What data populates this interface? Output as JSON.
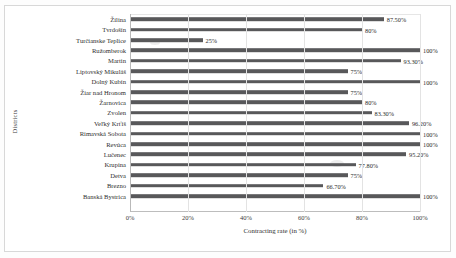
{
  "chart_data": {
    "type": "bar",
    "orientation": "horizontal",
    "title": "",
    "xlabel": "Contracting rate (in %)",
    "ylabel": "Districts",
    "xlim": [
      0,
      100
    ],
    "xticks": [
      "0%",
      "20%",
      "40%",
      "60%",
      "80%",
      "100%"
    ],
    "xtick_values": [
      0,
      20,
      40,
      60,
      80,
      100
    ],
    "grid": true,
    "legend": false,
    "bar_color": "#58585a",
    "categories": [
      "Žilina",
      "Tvrdošín",
      "Turčianske Teplice",
      "Ružomberok",
      "Martin",
      "Liptovský Mikuláš",
      "Dolný Kubín",
      "Žiar nad Hronom",
      "Žarnovica",
      "Zvolen",
      "Veľký Krťíš",
      "Rimavská Sobota",
      "Revúca",
      "Lučenec",
      "Krupina",
      "Detva",
      "Brezno",
      "Banská Bystrica"
    ],
    "values": [
      87.5,
      80,
      25,
      100,
      93.3,
      75,
      100,
      75,
      80,
      83.3,
      96.2,
      100,
      100,
      95.2,
      77.8,
      75,
      66.7,
      100
    ],
    "data_labels": [
      "87.50%",
      "80%",
      "25%",
      "100%",
      "93.30%",
      "75%",
      "100%",
      "75%",
      "80%",
      "83.30%",
      "96.20%",
      "100%",
      "100%",
      "95.20%",
      "77.80%",
      "75%",
      "66.70%",
      "100%"
    ]
  }
}
